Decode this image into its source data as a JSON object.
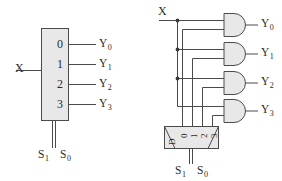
{
  "figure": {
    "ink_color": "#4a4a4a",
    "fill_color": "#e8e8e8",
    "text_color": "#2b2b2b"
  },
  "block_diagram": {
    "name": "demultiplexer-block-symbol",
    "data_input": {
      "label": "X"
    },
    "port_numbers": [
      "0",
      "1",
      "2",
      "3"
    ],
    "outputs": [
      {
        "base": "Y",
        "sub": "0"
      },
      {
        "base": "Y",
        "sub": "1"
      },
      {
        "base": "Y",
        "sub": "2"
      },
      {
        "base": "Y",
        "sub": "3"
      }
    ],
    "selects": [
      {
        "base": "S",
        "sub": "1"
      },
      {
        "base": "S",
        "sub": "0"
      }
    ]
  },
  "gate_diagram": {
    "name": "demultiplexer-gate-level",
    "data_input": {
      "label": "X"
    },
    "and_gates": [
      {
        "name": "and-gate-0"
      },
      {
        "name": "and-gate-1"
      },
      {
        "name": "and-gate-2"
      },
      {
        "name": "and-gate-3"
      }
    ],
    "outputs": [
      {
        "base": "Y",
        "sub": "0"
      },
      {
        "base": "Y",
        "sub": "1"
      },
      {
        "base": "Y",
        "sub": "2"
      },
      {
        "base": "Y",
        "sub": "3"
      }
    ],
    "decoder": {
      "name": "decoder-2-to-4",
      "enable_label": "D",
      "output_numbers": [
        "0",
        "1",
        "2",
        "3"
      ]
    },
    "selects": [
      {
        "base": "S",
        "sub": "1"
      },
      {
        "base": "S",
        "sub": "0"
      }
    ]
  }
}
